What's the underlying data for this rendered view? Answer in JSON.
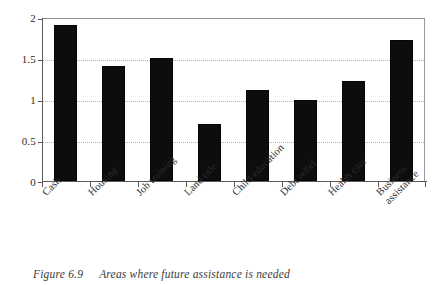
{
  "figure": {
    "caption_number": "Figure 6.9",
    "caption_text": "Areas where future assistance is needed"
  },
  "chart_data": {
    "type": "bar",
    "title": "",
    "xlabel": "",
    "ylabel": "",
    "ylim": [
      0,
      2
    ],
    "yticks": [
      0,
      0.5,
      1,
      1.5,
      2
    ],
    "ytick_labels": [
      "0",
      "0.5",
      "1",
      "1.5",
      "2"
    ],
    "grid": true,
    "grid_axis": "y",
    "grid_style": "dotted",
    "legend": false,
    "legend_position": "none",
    "bar_color": "#0d0d0d",
    "x_label_rotation": -45,
    "categories": [
      "Cash",
      "Housing",
      "Job training",
      "Land title",
      "Child education",
      "Debt relief",
      "Health care",
      "Business assistance"
    ],
    "category_lines": [
      [
        "Cash"
      ],
      [
        "Housing"
      ],
      [
        "Job training"
      ],
      [
        "Land title"
      ],
      [
        "Child education"
      ],
      [
        "Debt relief"
      ],
      [
        "Health care"
      ],
      [
        "Business",
        "assistance"
      ]
    ],
    "values": [
      1.9,
      1.4,
      1.5,
      0.7,
      1.11,
      0.99,
      1.22,
      1.72
    ]
  }
}
